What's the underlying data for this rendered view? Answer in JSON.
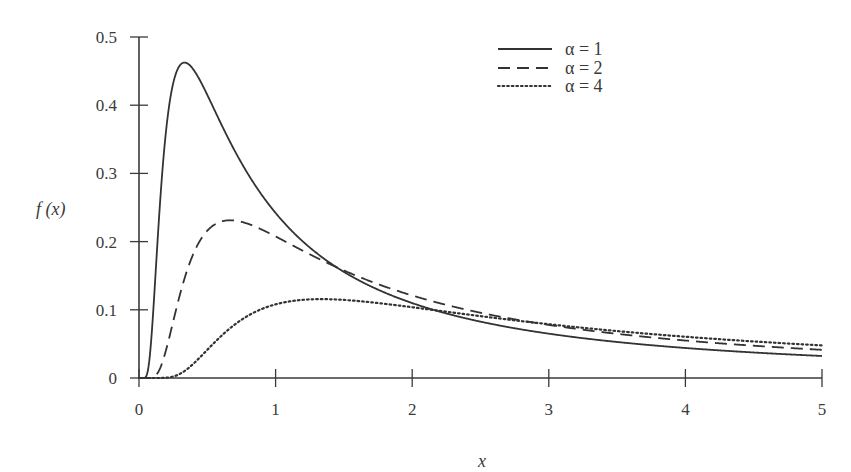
{
  "chart_data": {
    "type": "line",
    "title": "",
    "xlabel": "x",
    "ylabel": "f(x)",
    "xlim": [
      0,
      5
    ],
    "ylim": [
      0,
      0.5
    ],
    "xticks": [
      "0",
      "1",
      "2",
      "3",
      "4",
      "5"
    ],
    "yticks": [
      "0",
      "0.1",
      "0.2",
      "0.3",
      "0.4",
      "0.5"
    ],
    "grid": false,
    "legend_position": "upper right",
    "x": [
      0.05,
      0.1,
      0.2,
      0.3,
      0.333,
      0.4,
      0.5,
      0.667,
      0.8,
      1.0,
      1.333,
      1.5,
      2.0,
      2.5,
      3.0,
      3.5,
      4.0,
      4.5,
      5.0
    ],
    "series": [
      {
        "name": "α = 1",
        "style": "solid",
        "peak": [
          0.333,
          0.462
        ],
        "values": [
          0.0,
          0.008,
          0.365,
          0.455,
          0.462,
          0.449,
          0.416,
          0.355,
          0.3,
          0.242,
          0.162,
          0.132,
          0.108,
          0.082,
          0.065,
          0.053,
          0.044,
          0.037,
          0.032
        ]
      },
      {
        "name": "α = 2",
        "style": "dashed",
        "peak": [
          0.667,
          0.231
        ],
        "values": [
          0.0,
          0.0,
          0.044,
          0.151,
          0.182,
          0.218,
          0.229,
          0.231,
          0.226,
          0.207,
          0.173,
          0.161,
          0.138,
          0.117,
          0.103,
          0.09,
          0.081,
          0.072,
          0.041
        ]
      },
      {
        "name": "α = 4",
        "style": "dotted",
        "peak": [
          1.333,
          0.116
        ],
        "values": [
          0.0,
          0.0,
          0.0,
          0.006,
          0.012,
          0.03,
          0.06,
          0.095,
          0.108,
          0.114,
          0.116,
          0.115,
          0.108,
          0.098,
          0.089,
          0.08,
          0.072,
          0.065,
          0.048
        ]
      }
    ],
    "formula_note": "f(x) = sqrt(α/(2π)) · x^(-3/2) · exp(-α/(2x))",
    "alphas": [
      1,
      2,
      4
    ]
  },
  "labels": {
    "ylabel": "f (x)",
    "xlabel": "x",
    "legend": [
      "α = 1",
      "α = 2",
      "α = 4"
    ]
  },
  "colors": {
    "line": "#333333",
    "axis": "#3a3a3a"
  }
}
